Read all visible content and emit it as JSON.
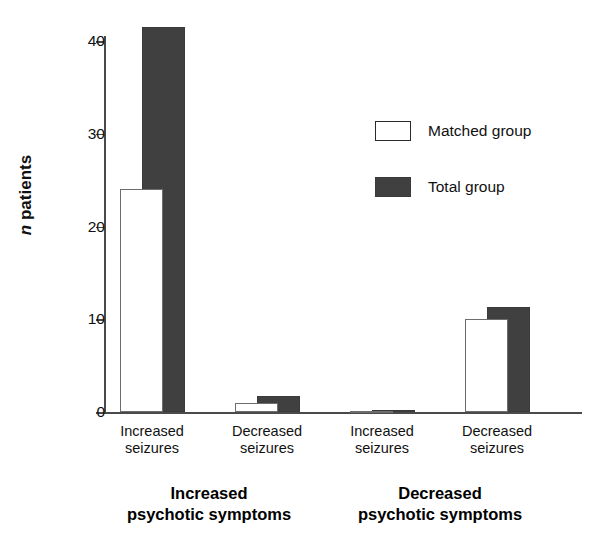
{
  "chart_data": {
    "type": "bar",
    "title": "",
    "xlabel": "",
    "ylabel": "n patients",
    "ylim": [
      0,
      43
    ],
    "yticks": [
      0,
      10,
      20,
      30,
      40
    ],
    "ytick_labels": [
      "0",
      "10",
      "20",
      "30",
      "40"
    ],
    "grid": false,
    "legend_position": "upper right",
    "categories": [
      "Increased seizures",
      "Decreased seizures",
      "Increased seizures",
      "Decreased seizures"
    ],
    "category_lines": [
      [
        "Increased",
        "seizures"
      ],
      [
        "Decreased",
        "seizures"
      ],
      [
        "Increased",
        "seizures"
      ],
      [
        "Decreased",
        "seizures"
      ]
    ],
    "groups": [
      {
        "label_line1": "Increased",
        "label_line2": "psychotic symptoms",
        "categories": [
          0,
          1
        ]
      },
      {
        "label_line1": "Decreased",
        "label_line2": "psychotic symptoms",
        "categories": [
          2,
          3
        ]
      }
    ],
    "series": [
      {
        "name": "Matched group",
        "color": "#ffffff",
        "values": [
          24,
          1,
          0.1,
          10
        ]
      },
      {
        "name": "Total group",
        "color": "#404040",
        "values": [
          41.5,
          1.7,
          0.2,
          11.3
        ]
      }
    ]
  },
  "axis": {
    "y_title_italic": "n",
    "y_title_rest": " patients"
  },
  "legend": {
    "items": [
      {
        "label": "Matched group",
        "style": "matched"
      },
      {
        "label": "Total group",
        "style": "total"
      }
    ]
  }
}
